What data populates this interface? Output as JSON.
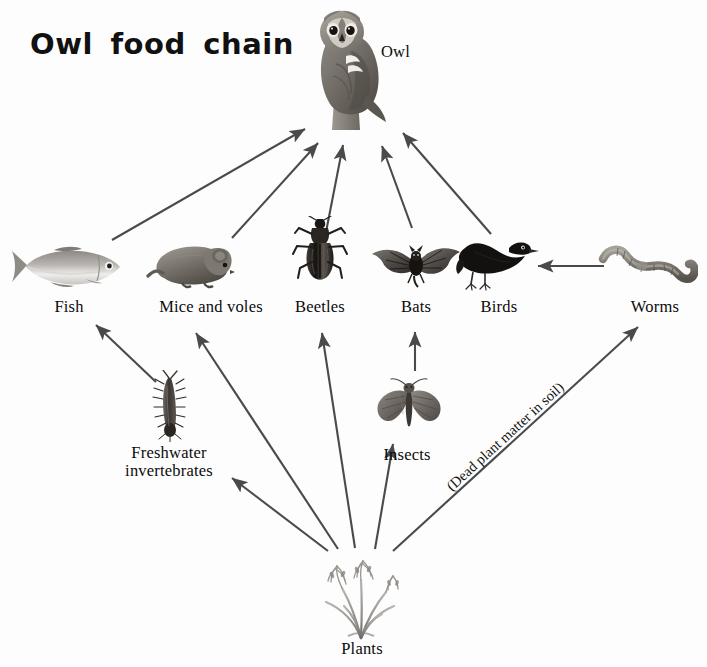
{
  "diagram": {
    "title": "Owl food chain",
    "background_color": "#fdfdfd",
    "arrow_color": "#4a4a4a",
    "text_color": "#0b0b0b",
    "nodes": [
      {
        "id": "owl",
        "label": "Owl",
        "trophic_level": "tertiary consumer / apex predator"
      },
      {
        "id": "fish",
        "label": "Fish",
        "trophic_level": "secondary consumer"
      },
      {
        "id": "mice",
        "label": "Mice and voles",
        "trophic_level": "primary consumer"
      },
      {
        "id": "beetles",
        "label": "Beetles",
        "trophic_level": "primary consumer"
      },
      {
        "id": "bats",
        "label": "Bats",
        "trophic_level": "secondary consumer"
      },
      {
        "id": "birds",
        "label": "Birds",
        "trophic_level": "secondary consumer"
      },
      {
        "id": "worms",
        "label": "Worms",
        "trophic_level": "decomposer / detritivore"
      },
      {
        "id": "freshwater",
        "label": "Freshwater\ninvertebrates",
        "trophic_level": "primary consumer"
      },
      {
        "id": "insects",
        "label": "Insects",
        "trophic_level": "primary consumer"
      },
      {
        "id": "plants",
        "label": "Plants",
        "trophic_level": "producer"
      }
    ],
    "edges": [
      {
        "from": "fish",
        "to": "owl",
        "note": ""
      },
      {
        "from": "mice",
        "to": "owl",
        "note": ""
      },
      {
        "from": "beetles",
        "to": "owl",
        "note": ""
      },
      {
        "from": "bats",
        "to": "owl",
        "note": ""
      },
      {
        "from": "birds",
        "to": "owl",
        "note": ""
      },
      {
        "from": "worms",
        "to": "birds",
        "note": ""
      },
      {
        "from": "freshwater",
        "to": "fish",
        "note": ""
      },
      {
        "from": "insects",
        "to": "bats",
        "note": ""
      },
      {
        "from": "plants",
        "to": "freshwater",
        "note": ""
      },
      {
        "from": "plants",
        "to": "mice",
        "note": ""
      },
      {
        "from": "plants",
        "to": "beetles",
        "note": ""
      },
      {
        "from": "plants",
        "to": "insects",
        "note": ""
      },
      {
        "from": "plants",
        "to": "worms",
        "note": "(Dead plant matter in soil)"
      }
    ],
    "annotation": "(Dead plant matter in soil)"
  }
}
